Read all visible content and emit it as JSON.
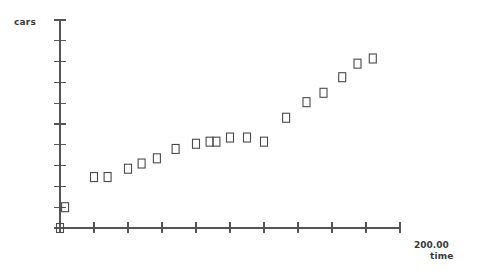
{
  "chart_data": {
    "type": "scatter",
    "title": "",
    "xlabel": "time",
    "ylabel": "cars",
    "xlim": [
      0,
      200
    ],
    "ylim": [
      0,
      10
    ],
    "grid": false,
    "legend": null,
    "marker": "open-square",
    "marker_color": "#4a4a4a",
    "axis_color": "#555555",
    "x_ticks": [
      0,
      20,
      40,
      60,
      80,
      100,
      120,
      140,
      160,
      180,
      200
    ],
    "x_tick_labels": [
      "",
      "",
      "",
      "",
      "",
      "",
      "",
      "",
      "",
      "",
      "200.00"
    ],
    "y_ticks": [
      0,
      1,
      2,
      3,
      4,
      5,
      6,
      7,
      8,
      9,
      10
    ],
    "y_tick_labels": [
      "",
      "",
      "",
      "",
      "",
      "",
      "",
      "",
      "",
      "",
      ""
    ],
    "x": [
      0,
      3,
      20,
      28,
      40,
      48,
      57,
      68,
      80,
      88,
      95,
      100,
      110,
      120,
      130,
      145,
      155,
      165,
      173,
      182,
      190
    ],
    "y": [
      0,
      1.0,
      2.45,
      2.45,
      2.85,
      3.1,
      3.35,
      3.8,
      4.05,
      4.15,
      4.15,
      4.3,
      4.35,
      4.2,
      5.25,
      6.0,
      6.45,
      7.2,
      7.9,
      8.15
    ],
    "points": [
      {
        "x": 0,
        "y": 0.0
      },
      {
        "x": 3,
        "y": 1.0
      },
      {
        "x": 20,
        "y": 2.45
      },
      {
        "x": 28,
        "y": 2.45
      },
      {
        "x": 40,
        "y": 2.85
      },
      {
        "x": 48,
        "y": 3.1
      },
      {
        "x": 57,
        "y": 3.35
      },
      {
        "x": 68,
        "y": 3.8
      },
      {
        "x": 80,
        "y": 4.05
      },
      {
        "x": 88,
        "y": 4.15
      },
      {
        "x": 92,
        "y": 4.15
      },
      {
        "x": 100,
        "y": 4.35
      },
      {
        "x": 110,
        "y": 4.35
      },
      {
        "x": 120,
        "y": 4.15
      },
      {
        "x": 133,
        "y": 5.3
      },
      {
        "x": 145,
        "y": 6.05
      },
      {
        "x": 155,
        "y": 6.5
      },
      {
        "x": 166,
        "y": 7.25
      },
      {
        "x": 175,
        "y": 7.9
      },
      {
        "x": 184,
        "y": 8.15
      }
    ]
  },
  "axes": {
    "y_title": "cars",
    "x_title": "time",
    "x_max_label": "200.00"
  }
}
